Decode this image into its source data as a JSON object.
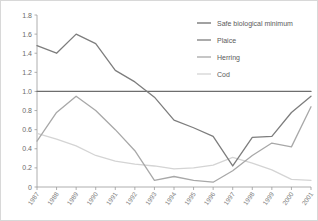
{
  "chart_data": {
    "type": "line",
    "title": "",
    "subtitle": "",
    "xlabel": "",
    "ylabel": "",
    "categories": [
      "1987",
      "1988",
      "1989",
      "1990",
      "1991",
      "1992",
      "1993",
      "1994",
      "1995",
      "1996",
      "1997",
      "1998",
      "1999",
      "2000",
      "2001"
    ],
    "x": [
      1987,
      1988,
      1989,
      1990,
      1991,
      1992,
      1993,
      1994,
      1995,
      1996,
      1997,
      1998,
      1999,
      2000,
      2001
    ],
    "ylim": [
      0,
      1.8
    ],
    "xlim": [
      1987,
      2001
    ],
    "yticks": [
      "0",
      "0.2",
      "0.4",
      "0.6",
      "0.8",
      "1.0",
      "1.2",
      "1.4",
      "1.6",
      "1.8"
    ],
    "ytick_values": [
      0,
      0.2,
      0.4,
      0.6,
      0.8,
      1.0,
      1.2,
      1.4,
      1.6,
      1.8
    ],
    "grid": false,
    "legend_position": "top-right",
    "series": [
      {
        "name": "Safe biological minimum",
        "color": "#6e6e6e",
        "values": [
          1.0,
          1.0,
          1.0,
          1.0,
          1.0,
          1.0,
          1.0,
          1.0,
          1.0,
          1.0,
          1.0,
          1.0,
          1.0,
          1.0,
          1.0
        ]
      },
      {
        "name": "Plaice",
        "color": "#7d7d7d",
        "values": [
          1.48,
          1.4,
          1.6,
          1.5,
          1.22,
          1.1,
          0.94,
          0.7,
          0.62,
          0.53,
          0.22,
          0.52,
          0.53,
          0.78,
          0.95
        ]
      },
      {
        "name": "Herring",
        "color": "#a8a8a8",
        "values": [
          0.48,
          0.78,
          0.95,
          0.8,
          0.6,
          0.38,
          0.07,
          0.11,
          0.07,
          0.05,
          0.17,
          0.33,
          0.46,
          0.42,
          0.84
        ]
      },
      {
        "name": "Cod",
        "color": "#d4d4d4",
        "values": [
          0.56,
          0.5,
          0.43,
          0.33,
          0.27,
          0.24,
          0.22,
          0.19,
          0.2,
          0.23,
          0.31,
          0.25,
          0.18,
          0.08,
          0.07
        ]
      }
    ]
  },
  "legend": {
    "items": [
      {
        "label": "Safe biological minimum",
        "color": "#6e6e6e"
      },
      {
        "label": "Plaice",
        "color": "#7d7d7d"
      },
      {
        "label": "Herring",
        "color": "#a8a8a8"
      },
      {
        "label": "Cod",
        "color": "#d4d4d4"
      }
    ]
  },
  "axes": {
    "y_tick_labels": [
      "1.8",
      "1.6",
      "1.4",
      "1.2",
      "1.0",
      "0.8",
      "0.6",
      "0.4",
      "0.2",
      "0"
    ],
    "x_tick_labels": [
      "1987",
      "1988",
      "1989",
      "1990",
      "1991",
      "1992",
      "1993",
      "1994",
      "1995",
      "1996",
      "1997",
      "1998",
      "1999",
      "2000",
      "2001"
    ]
  },
  "colors": {
    "background": "#ffffff",
    "axis": "#9a9a9a",
    "tick_text": "#6b6b6b",
    "legend_text": "#5a5a5a"
  }
}
